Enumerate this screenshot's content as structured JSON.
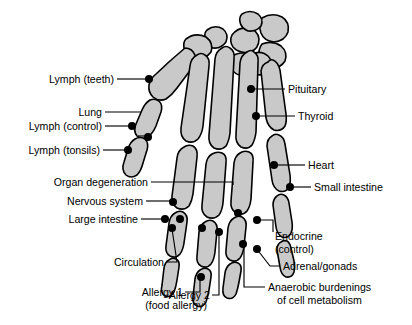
{
  "diagram": {
    "colors": {
      "bone_fill": "#c9c9c9",
      "outline": "#000000",
      "background": "#ffffff",
      "marker": "#000000"
    }
  },
  "labels": {
    "left": [
      {
        "id": "lymph-teeth",
        "text": "Lymph (teeth)"
      },
      {
        "id": "lung",
        "text": "Lung"
      },
      {
        "id": "lymph-control",
        "text": "Lymph (control)"
      },
      {
        "id": "lymph-tonsils",
        "text": "Lymph (tonsils)"
      },
      {
        "id": "organ-degeneration",
        "text": "Organ degeneration"
      },
      {
        "id": "nervous-system",
        "text": "Nervous system"
      },
      {
        "id": "large-intestine",
        "text": "Large intestine"
      }
    ],
    "right": [
      {
        "id": "pituitary",
        "text": "Pituitary"
      },
      {
        "id": "thyroid",
        "text": "Thyroid"
      },
      {
        "id": "heart",
        "text": "Heart"
      },
      {
        "id": "small-intestine",
        "text": "Small intestine"
      },
      {
        "id": "endocrine-control-line1",
        "text": "Endocrine"
      },
      {
        "id": "endocrine-control-line2",
        "text": "(control)"
      },
      {
        "id": "adrenal-gonads",
        "text": "Adrenal/gonads"
      },
      {
        "id": "anaerobic-line1",
        "text": "Anaerobic burdenings"
      },
      {
        "id": "anaerobic-line2",
        "text": "of cell metabolism"
      }
    ],
    "bottom": [
      {
        "id": "circulation",
        "text": "Circulation"
      },
      {
        "id": "allergy-1-line1",
        "text": "Allergy 1"
      },
      {
        "id": "allergy-1-line2",
        "text": "(food allergy)"
      },
      {
        "id": "allergy-2",
        "text": "Allergy 2"
      }
    ]
  }
}
